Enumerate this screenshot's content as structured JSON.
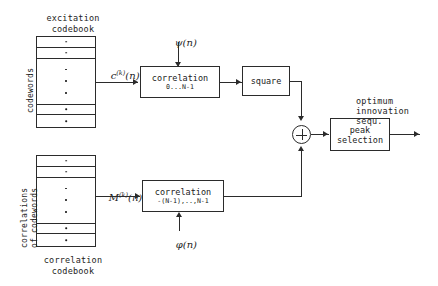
{
  "diagram": {
    "excitation_codebook": {
      "caption_line1": "excitation",
      "caption_line2": "codebook",
      "side_label": "codewords",
      "cell_marker": "·",
      "rows_top": 2,
      "rows_middle_dots": 3,
      "rows_bottom": 2
    },
    "correlation_codebook": {
      "caption_line1": "correlation",
      "caption_line2": "codebook",
      "side_label_line1": "correlations",
      "side_label_line2": "of codewords",
      "cell_marker": "·",
      "rows_top": 2,
      "rows_middle_dots": 3,
      "rows_bottom": 2
    },
    "blocks": {
      "correlation_top": {
        "label": "correlation",
        "range": "0...N-1"
      },
      "square": {
        "label": "square"
      },
      "correlation_bottom": {
        "label": "correlation",
        "range": "-(N-1),..,N-1"
      },
      "peak_selection": {
        "label_line1": "peak",
        "label_line2": "selection"
      }
    },
    "summing_junction": {
      "symbol": "+"
    },
    "signals": {
      "excitation_out_base": "c",
      "excitation_out_sup": "(k)",
      "excitation_out_arg": "(n)",
      "psi_input_base": "ψ",
      "psi_input_arg": "(n)",
      "correlation_out_base": "M",
      "correlation_out_sup": "(k)",
      "correlation_out_arg": "(n)",
      "phi_input_base": "φ",
      "phi_input_arg": "(n)",
      "output_line1": "optimum",
      "output_line2": "innovation",
      "output_line3": "sequ."
    },
    "colors": {
      "ink": "#1d1d1d",
      "line": "#2b2b2b",
      "background": "#ffffff"
    }
  }
}
